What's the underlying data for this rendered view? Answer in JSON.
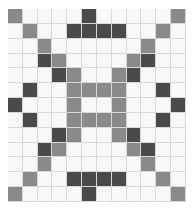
{
  "figure": {
    "background_color": "#ffffff",
    "margin_left_px": 8,
    "margin_top_px": 9
  },
  "quilt": {
    "name": "double-wedding-ring-quilt-block",
    "columns": 12,
    "rows": 13,
    "width_px": 178,
    "height_px": 193,
    "palette": {
      "white": "#f8f8f8",
      "medium_gray": "#8a8a8a",
      "dark_gray": "#4a4a4a",
      "seam_line": "#d8d8d8",
      "block_border": "#c9c9c9"
    },
    "legend": [
      {
        "code": "w",
        "label": "White patch",
        "color": "#f8f8f8"
      },
      {
        "code": "m",
        "label": "Medium gray patch",
        "color": "#8a8a8a"
      },
      {
        "code": "d",
        "label": "Dark gray patch",
        "color": "#4a4a4a"
      }
    ],
    "grid": [
      [
        "m",
        "w",
        "w",
        "w",
        "w",
        "d",
        "w",
        "w",
        "w",
        "w",
        "w",
        "m"
      ],
      [
        "w",
        "m",
        "w",
        "w",
        "d",
        "d",
        "d",
        "d",
        "w",
        "w",
        "m",
        "w"
      ],
      [
        "w",
        "w",
        "m",
        "w",
        "w",
        "w",
        "w",
        "w",
        "w",
        "m",
        "w",
        "w"
      ],
      [
        "w",
        "w",
        "d",
        "m",
        "w",
        "w",
        "w",
        "w",
        "m",
        "d",
        "w",
        "w"
      ],
      [
        "w",
        "w",
        "w",
        "d",
        "m",
        "w",
        "w",
        "m",
        "d",
        "w",
        "w",
        "w"
      ],
      [
        "w",
        "d",
        "w",
        "w",
        "m",
        "m",
        "m",
        "m",
        "w",
        "w",
        "d",
        "w"
      ],
      [
        "d",
        "w",
        "w",
        "w",
        "m",
        "w",
        "w",
        "m",
        "w",
        "w",
        "w",
        "d"
      ],
      [
        "w",
        "d",
        "w",
        "w",
        "m",
        "m",
        "m",
        "m",
        "w",
        "w",
        "d",
        "w"
      ],
      [
        "w",
        "w",
        "w",
        "d",
        "m",
        "w",
        "w",
        "m",
        "d",
        "w",
        "w",
        "w"
      ],
      [
        "w",
        "w",
        "d",
        "m",
        "w",
        "w",
        "w",
        "w",
        "m",
        "d",
        "w",
        "w"
      ],
      [
        "w",
        "w",
        "m",
        "w",
        "w",
        "w",
        "w",
        "w",
        "w",
        "m",
        "w",
        "w"
      ],
      [
        "w",
        "m",
        "w",
        "w",
        "d",
        "d",
        "d",
        "d",
        "w",
        "w",
        "m",
        "w"
      ],
      [
        "m",
        "w",
        "w",
        "w",
        "w",
        "d",
        "w",
        "w",
        "w",
        "w",
        "w",
        "m"
      ]
    ]
  }
}
